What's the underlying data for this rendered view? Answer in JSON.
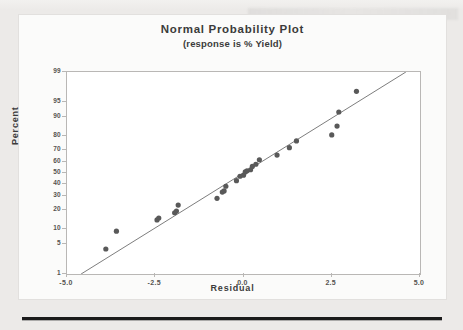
{
  "figure": {
    "title": "Normal Probability Plot",
    "subtitle": "(response is % Yield)",
    "xlabel": "Residual",
    "ylabel": "Percent"
  },
  "colors": {
    "page_background": "#eceae8",
    "panel_background": "#fbfbfa",
    "plot_background": "#ffffff",
    "frame": "#b9b7b5",
    "marker": "#595959",
    "fit_line": "#6e6e6e",
    "text": "#3b3b3b",
    "tick_text": "#55534f",
    "rule": "#1b1b1b"
  },
  "chart_data": {
    "type": "scatter",
    "title": "Normal Probability Plot",
    "subtitle": "(response is % Yield)",
    "xlabel": "Residual",
    "ylabel": "Percent",
    "xlim": [
      -5.0,
      5.0
    ],
    "ylim": [
      1,
      99
    ],
    "yscale": "normal-probability",
    "grid": false,
    "legend": null,
    "xticks": [
      "-5.0",
      "-2.5",
      "0.0",
      "2.5",
      "5.0"
    ],
    "xtick_values": [
      -5.0,
      -2.5,
      0.0,
      2.5,
      5.0
    ],
    "yticks": [
      "99",
      "95",
      "90",
      "80",
      "70",
      "60",
      "50",
      "40",
      "30",
      "20",
      "10",
      "5",
      "1"
    ],
    "ytick_values": [
      99,
      95,
      90,
      80,
      70,
      60,
      50,
      40,
      30,
      20,
      10,
      5,
      1
    ],
    "series": [
      {
        "name": "residuals",
        "marker": "filled-circle",
        "x": [
          -3.9,
          -3.6,
          -2.45,
          -2.4,
          -1.95,
          -1.9,
          -1.85,
          -0.75,
          -0.6,
          -0.55,
          -0.5,
          -0.2,
          -0.1,
          0.0,
          0.05,
          0.1,
          0.2,
          0.25,
          0.35,
          0.45,
          0.95,
          1.3,
          1.5,
          2.5,
          2.65,
          2.7,
          3.2
        ],
        "y": [
          4,
          9,
          14,
          15,
          18,
          19,
          23,
          28,
          33,
          34,
          38,
          43,
          47,
          48,
          51,
          52,
          53,
          56,
          58,
          62,
          66,
          72,
          77,
          81,
          86,
          92,
          97
        ]
      }
    ],
    "reference_line": {
      "name": "normal-fit-line",
      "x_start": -4.6,
      "y_start": 1,
      "x_end": 4.6,
      "y_end": 99
    }
  }
}
